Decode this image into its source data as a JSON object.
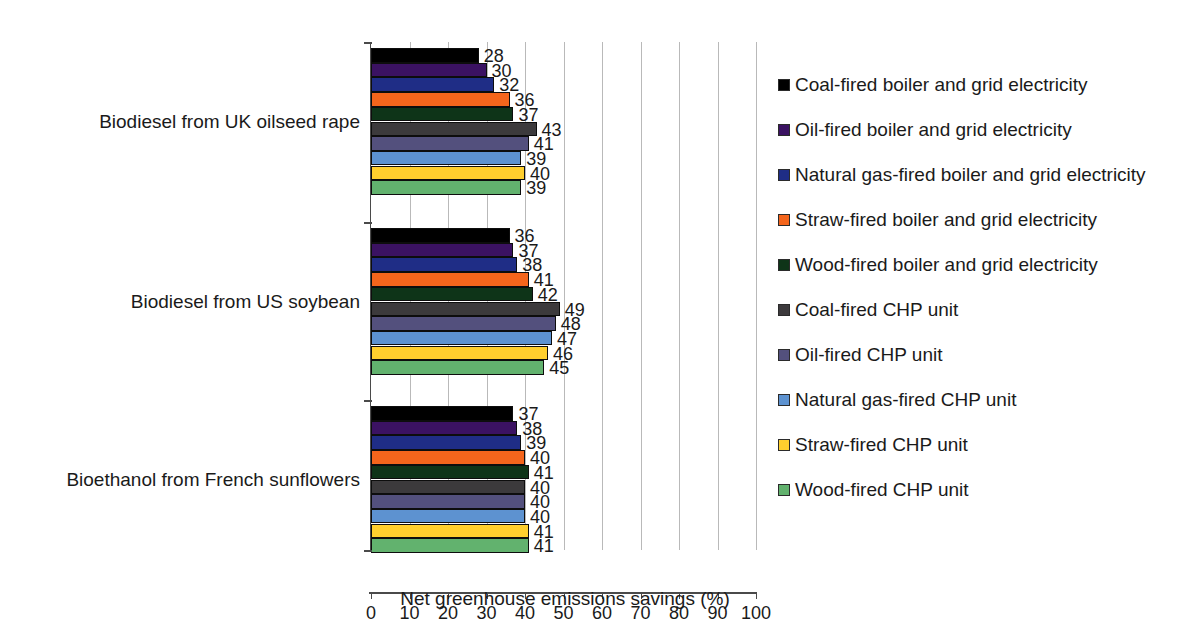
{
  "chart_data": {
    "type": "bar",
    "orientation": "horizontal",
    "title": "",
    "xlabel": "Net greenhouse emissions savings (%)",
    "ylabel": "",
    "xlim": [
      0,
      100
    ],
    "xticks": [
      0,
      10,
      20,
      30,
      40,
      50,
      60,
      70,
      80,
      90,
      100
    ],
    "xtick_labels": [
      "0",
      "10",
      "20",
      "30",
      "40",
      "50",
      "60",
      "70",
      "80",
      "90",
      "100"
    ],
    "grid": "vertical",
    "legend_position": "right",
    "categories": [
      "Biodiesel from UK oilseed rape",
      "Biodiesel from US soybean",
      "Bioethanol from French sunflowers"
    ],
    "series": [
      {
        "name": "Coal-fired boiler and grid electricity",
        "color": "#000000",
        "values": [
          28,
          36,
          37
        ]
      },
      {
        "name": "Oil-fired boiler and grid electricity",
        "color": "#3b1262",
        "values": [
          30,
          37,
          38
        ]
      },
      {
        "name": "Natural gas-fired boiler and grid electricity",
        "color": "#1f2d86",
        "values": [
          32,
          38,
          39
        ]
      },
      {
        "name": "Straw-fired boiler and grid electricity",
        "color": "#f4651c",
        "values": [
          36,
          41,
          40
        ]
      },
      {
        "name": "Wood-fired boiler and grid electricity",
        "color": "#0e3418",
        "values": [
          37,
          42,
          41
        ]
      },
      {
        "name": "Coal-fired CHP unit",
        "color": "#3c3a3c",
        "values": [
          43,
          49,
          40
        ]
      },
      {
        "name": "Oil-fired CHP unit",
        "color": "#53507d",
        "values": [
          41,
          48,
          40
        ]
      },
      {
        "name": "Natural gas-fired CHP unit",
        "color": "#5d92d0",
        "values": [
          39,
          47,
          40
        ]
      },
      {
        "name": "Straw-fired CHP unit",
        "color": "#ffcf2e",
        "values": [
          40,
          46,
          41
        ]
      },
      {
        "name": "Wood-fired CHP unit",
        "color": "#62b26e",
        "values": [
          39,
          45,
          41
        ]
      }
    ]
  },
  "axis": {
    "x_title": "Net greenhouse emissions savings (%)"
  }
}
